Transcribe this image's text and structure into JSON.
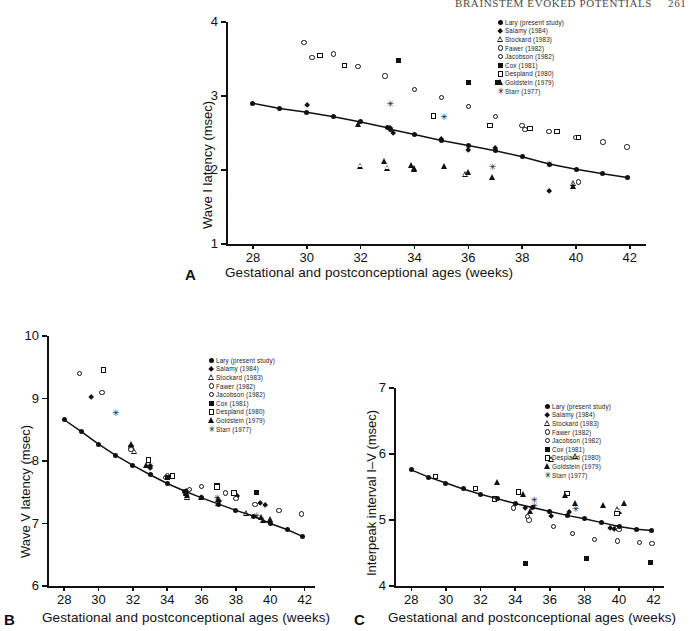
{
  "running_head": {
    "title": "BRAINSTEM EVOKED POTENTIALS",
    "page": "261"
  },
  "legend_entries": [
    {
      "symbol": "filled-circle",
      "label": "Lary (present study)"
    },
    {
      "symbol": "filled-diamond",
      "label": "Salamy (1984)"
    },
    {
      "symbol": "open-triangle",
      "label": "Stockard (1983)"
    },
    {
      "symbol": "open-circle",
      "label": "Fawer (1982)"
    },
    {
      "symbol": "open-circle",
      "label": "Jacobson (1982)"
    },
    {
      "symbol": "filled-square",
      "label": "Cox (1981)"
    },
    {
      "symbol": "open-square",
      "label": "Despland (1980)"
    },
    {
      "symbol": "filled-triangle",
      "label": "Goldstein (1979)"
    },
    {
      "symbol": "star",
      "label": "Starr (1977)"
    }
  ],
  "shared": {
    "xlabel": "Gestational and postconceptional ages (weeks)",
    "xticks": [
      28,
      30,
      32,
      34,
      36,
      38,
      40,
      42
    ],
    "xlim": [
      27,
      42.6
    ]
  },
  "panels": {
    "A": {
      "letter": "A",
      "ylabel": "Wave I latency (msec)",
      "yticks": [
        1,
        2,
        3,
        4
      ],
      "ylim": [
        1,
        4
      ]
    },
    "B": {
      "letter": "B",
      "ylabel": "Wave V latency (msec)",
      "yticks": [
        6,
        7,
        8,
        9,
        10
      ],
      "ylim": [
        6,
        10
      ]
    },
    "C": {
      "letter": "C",
      "ylabel": "Interpeak interval I–V (msec)",
      "yticks": [
        4,
        5,
        6,
        7
      ],
      "ylim": [
        4,
        7
      ]
    }
  },
  "chart_data": [
    {
      "id": "A",
      "type": "scatter",
      "title": "Wave I latency vs gestational age",
      "xlabel": "Gestational and postconceptional ages (weeks)",
      "ylabel": "Wave I latency (msec)",
      "xlim": [
        27,
        42.6
      ],
      "ylim": [
        1,
        4
      ],
      "xticks": [
        28,
        30,
        32,
        34,
        36,
        38,
        40,
        42
      ],
      "yticks": [
        1,
        2,
        3,
        4
      ],
      "grid": false,
      "legend_position": "top-right-outside",
      "trendline": {
        "name": "Lary (present study)",
        "symbol": "filled-circle",
        "points": [
          [
            28.0,
            2.9
          ],
          [
            29.0,
            2.83
          ],
          [
            30.0,
            2.78
          ],
          [
            31.0,
            2.72
          ],
          [
            32.0,
            2.65
          ],
          [
            33.0,
            2.57
          ],
          [
            33.1,
            2.55
          ],
          [
            34.0,
            2.48
          ],
          [
            35.0,
            2.4
          ],
          [
            36.0,
            2.33
          ],
          [
            37.0,
            2.26
          ],
          [
            38.0,
            2.18
          ],
          [
            39.0,
            2.08
          ],
          [
            40.0,
            2.01
          ],
          [
            41.0,
            1.95
          ],
          [
            41.9,
            1.9
          ]
        ]
      },
      "series": [
        {
          "name": "Salamy (1984)",
          "symbol": "filled-diamond",
          "points": [
            [
              30.0,
              2.88
            ],
            [
              33.1,
              2.56
            ],
            [
              33.2,
              2.5
            ],
            [
              35.0,
              2.42
            ],
            [
              36.0,
              2.27
            ],
            [
              37.0,
              2.3
            ],
            [
              39.0,
              1.72
            ]
          ]
        },
        {
          "name": "Stockard (1983)",
          "symbol": "open-triangle",
          "points": [
            [
              32.0,
              2.06
            ],
            [
              33.0,
              2.03
            ],
            [
              34.0,
              2.02
            ],
            [
              35.9,
              1.94
            ],
            [
              39.9,
              1.82
            ]
          ]
        },
        {
          "name": "Fawer (1982)",
          "symbol": "open-circle",
          "points": [
            [
              29.9,
              3.72
            ],
            [
              31.0,
              3.57
            ],
            [
              31.9,
              3.4
            ],
            [
              32.9,
              3.27
            ],
            [
              34.0,
              3.09
            ],
            [
              35.0,
              2.98
            ],
            [
              36.0,
              2.86
            ],
            [
              37.0,
              2.72
            ],
            [
              38.0,
              2.6
            ],
            [
              39.0,
              2.52
            ],
            [
              40.0,
              2.44
            ],
            [
              41.0,
              2.38
            ],
            [
              41.9,
              2.31
            ]
          ]
        },
        {
          "name": "Jacobson (1982)",
          "symbol": "open-circle",
          "points": [
            [
              30.2,
              3.52
            ],
            [
              38.1,
              2.55
            ],
            [
              40.1,
              1.84
            ]
          ]
        },
        {
          "name": "Cox (1981)",
          "symbol": "filled-square",
          "points": [
            [
              33.4,
              3.48
            ],
            [
              36.0,
              3.18
            ],
            [
              37.1,
              3.18
            ]
          ]
        },
        {
          "name": "Despland (1980)",
          "symbol": "open-square",
          "points": [
            [
              30.5,
              3.55
            ],
            [
              31.4,
              3.41
            ],
            [
              34.7,
              2.73
            ],
            [
              36.8,
              2.6
            ],
            [
              38.3,
              2.56
            ],
            [
              39.3,
              2.52
            ],
            [
              40.1,
              2.44
            ]
          ]
        },
        {
          "name": "Goldstein (1979)",
          "symbol": "filled-triangle",
          "points": [
            [
              31.9,
              2.62
            ],
            [
              32.9,
              2.12
            ],
            [
              33.9,
              2.07
            ],
            [
              34.0,
              2.03
            ],
            [
              35.1,
              2.05
            ],
            [
              36.0,
              1.97
            ],
            [
              36.9,
              1.9
            ],
            [
              39.9,
              1.78
            ]
          ]
        },
        {
          "name": "Starr (1977)",
          "symbol": "star",
          "points": [
            [
              33.1,
              2.88
            ],
            [
              35.1,
              2.71
            ],
            [
              36.9,
              2.04
            ],
            [
              39.0,
              2.07
            ]
          ]
        }
      ]
    },
    {
      "id": "B",
      "type": "scatter",
      "title": "Wave V latency vs gestational age",
      "xlabel": "Gestational and postconceptional ages (weeks)",
      "ylabel": "Wave V latency (msec)",
      "xlim": [
        27,
        42.6
      ],
      "ylim": [
        6,
        10
      ],
      "xticks": [
        28,
        30,
        32,
        34,
        36,
        38,
        40,
        42
      ],
      "yticks": [
        6,
        7,
        8,
        9,
        10
      ],
      "grid": false,
      "legend_position": "top-right-inside",
      "trendline": {
        "name": "Lary (present study)",
        "symbol": "filled-circle",
        "points": [
          [
            28.0,
            8.66
          ],
          [
            29.0,
            8.47
          ],
          [
            30.0,
            8.27
          ],
          [
            31.0,
            8.09
          ],
          [
            32.0,
            7.93
          ],
          [
            33.0,
            7.78
          ],
          [
            34.0,
            7.64
          ],
          [
            35.0,
            7.52
          ],
          [
            36.0,
            7.41
          ],
          [
            37.0,
            7.31
          ],
          [
            38.0,
            7.21
          ],
          [
            39.0,
            7.12
          ],
          [
            40.0,
            7.0
          ],
          [
            41.0,
            6.9
          ],
          [
            41.9,
            6.79
          ]
        ]
      },
      "series": [
        {
          "name": "Salamy (1984)",
          "symbol": "filled-diamond",
          "points": [
            [
              29.6,
              9.02
            ],
            [
              33.0,
              7.92
            ],
            [
              33.0,
              7.88
            ],
            [
              35.1,
              7.52
            ],
            [
              37.0,
              7.36
            ],
            [
              38.1,
              7.44
            ],
            [
              39.4,
              7.33
            ],
            [
              39.7,
              7.29
            ]
          ]
        },
        {
          "name": "Stockard (1983)",
          "symbol": "open-triangle",
          "points": [
            [
              31.9,
              8.22
            ],
            [
              32.1,
              8.16
            ],
            [
              35.1,
              7.49
            ],
            [
              35.2,
              7.42
            ],
            [
              37.0,
              7.33
            ],
            [
              38.6,
              7.17
            ],
            [
              39.6,
              7.06
            ],
            [
              36.0,
              7.43
            ]
          ]
        },
        {
          "name": "Fawer (1982)",
          "symbol": "open-circle",
          "points": [
            [
              28.9,
              9.4
            ],
            [
              30.2,
              9.1
            ],
            [
              31.9,
              8.23
            ],
            [
              34.0,
              7.77
            ],
            [
              36.0,
              7.59
            ],
            [
              37.4,
              7.49
            ],
            [
              38.0,
              7.4
            ],
            [
              39.1,
              7.3
            ],
            [
              40.5,
              7.21
            ],
            [
              41.8,
              7.15
            ]
          ]
        },
        {
          "name": "Jacobson (1982)",
          "symbol": "open-circle",
          "points": [
            [
              31.9,
              8.18
            ],
            [
              33.9,
              7.74
            ],
            [
              35.3,
              7.54
            ]
          ]
        },
        {
          "name": "Cox (1981)",
          "symbol": "filled-square",
          "points": [
            [
              34.0,
              7.74
            ],
            [
              36.9,
              7.6
            ],
            [
              39.2,
              7.5
            ]
          ]
        },
        {
          "name": "Despland (1980)",
          "symbol": "open-square",
          "points": [
            [
              30.3,
              9.46
            ],
            [
              32.9,
              8.02
            ],
            [
              34.3,
              7.76
            ],
            [
              36.9,
              7.58
            ],
            [
              37.9,
              7.49
            ]
          ]
        },
        {
          "name": "Goldstein (1979)",
          "symbol": "filled-triangle",
          "points": [
            [
              31.9,
              8.28
            ],
            [
              32.8,
              7.94
            ],
            [
              35.1,
              7.5
            ],
            [
              35.2,
              7.45
            ],
            [
              37.0,
              7.39
            ],
            [
              39.5,
              7.1
            ],
            [
              40.0,
              7.07
            ]
          ]
        },
        {
          "name": "Starr (1977)",
          "symbol": "star",
          "points": [
            [
              31.0,
              8.76
            ],
            [
              33.0,
              7.91
            ],
            [
              36.9,
              7.4
            ],
            [
              39.2,
              7.12
            ]
          ]
        }
      ]
    },
    {
      "id": "C",
      "type": "scatter",
      "title": "Interpeak interval I–V vs gestational age",
      "xlabel": "Gestational and postconceptional ages (weeks)",
      "ylabel": "Interpeak interval I–V (msec)",
      "xlim": [
        27,
        42.6
      ],
      "ylim": [
        4,
        7
      ],
      "xticks": [
        28,
        30,
        32,
        34,
        36,
        38,
        40,
        42
      ],
      "yticks": [
        4,
        5,
        6,
        7
      ],
      "grid": false,
      "legend_position": "top-right-inside",
      "trendline": {
        "name": "Lary (present study)",
        "symbol": "filled-circle",
        "points": [
          [
            28.0,
            5.76
          ],
          [
            29.0,
            5.65
          ],
          [
            30.0,
            5.56
          ],
          [
            31.0,
            5.47
          ],
          [
            32.0,
            5.39
          ],
          [
            33.0,
            5.32
          ],
          [
            34.0,
            5.25
          ],
          [
            35.0,
            5.19
          ],
          [
            36.0,
            5.13
          ],
          [
            37.0,
            5.07
          ],
          [
            38.0,
            5.02
          ],
          [
            39.0,
            4.96
          ],
          [
            40.0,
            4.9
          ],
          [
            41.0,
            4.86
          ],
          [
            41.9,
            4.84
          ]
        ]
      },
      "series": [
        {
          "name": "Salamy (1984)",
          "symbol": "filled-diamond",
          "points": [
            [
              34.6,
              5.18
            ],
            [
              36.1,
              5.06
            ],
            [
              37.1,
              5.12
            ],
            [
              39.5,
              4.88
            ],
            [
              39.7,
              4.86
            ]
          ]
        },
        {
          "name": "Stockard (1983)",
          "symbol": "open-triangle",
          "points": [
            [
              36.1,
              5.92
            ],
            [
              37.5,
              5.97
            ],
            [
              39.9,
              5.16
            ],
            [
              40.0,
              5.14
            ]
          ]
        },
        {
          "name": "Fawer (1982)",
          "symbol": "open-circle",
          "points": [
            [
              33.9,
              5.18
            ],
            [
              34.8,
              5.0
            ],
            [
              36.2,
              4.9
            ],
            [
              37.3,
              4.8
            ],
            [
              38.6,
              4.7
            ],
            [
              39.9,
              4.68
            ],
            [
              41.2,
              4.66
            ],
            [
              41.9,
              4.64
            ]
          ]
        },
        {
          "name": "Jacobson (1982)",
          "symbol": "open-circle",
          "points": [
            [
              34.7,
              5.05
            ],
            [
              39.9,
              4.88
            ],
            [
              40.0,
              4.86
            ]
          ]
        },
        {
          "name": "Cox (1981)",
          "symbol": "filled-square",
          "points": [
            [
              34.6,
              4.34
            ],
            [
              38.1,
              4.42
            ],
            [
              41.8,
              4.35
            ]
          ]
        },
        {
          "name": "Despland (1980)",
          "symbol": "open-square",
          "points": [
            [
              29.4,
              5.66
            ],
            [
              31.7,
              5.48
            ],
            [
              32.8,
              5.32
            ],
            [
              34.2,
              5.42
            ],
            [
              37.0,
              5.4
            ],
            [
              39.9,
              5.1
            ]
          ]
        },
        {
          "name": "Goldstein (1979)",
          "symbol": "filled-triangle",
          "points": [
            [
              33.0,
              5.58
            ],
            [
              34.5,
              5.4
            ],
            [
              34.9,
              5.14
            ],
            [
              36.9,
              5.38
            ],
            [
              37.5,
              5.26
            ],
            [
              39.1,
              5.22
            ],
            [
              40.3,
              5.26
            ]
          ]
        },
        {
          "name": "Starr (1977)",
          "symbol": "star",
          "points": [
            [
              35.1,
              5.3
            ],
            [
              35.1,
              5.2
            ],
            [
              37.5,
              5.16
            ]
          ]
        }
      ]
    }
  ]
}
